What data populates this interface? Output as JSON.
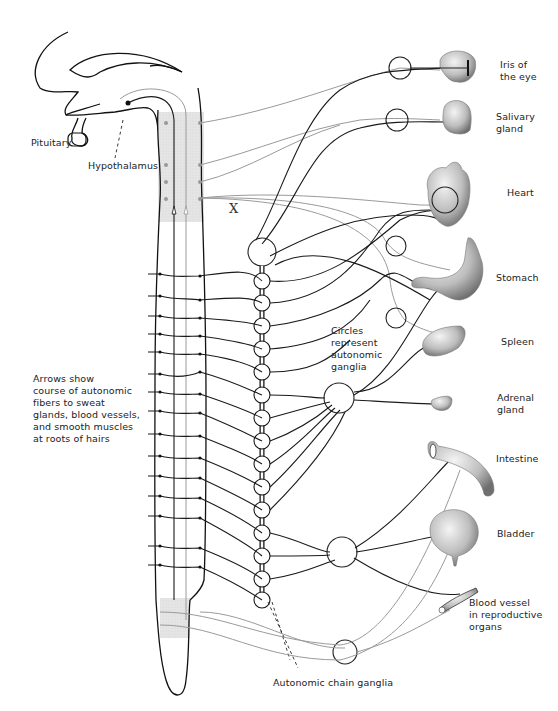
{
  "labels": {
    "pituitary": "Pituitary",
    "hypothalamus": "Hypothalamus",
    "x_marker": "X",
    "arrows_note": "Arrows show\ncourse of autonomic\nfibers to sweat\nglands, blood vessels,\nand smooth muscles\nat roots of hairs",
    "circles_note": "Circles\nrepresent\nautonomic\nganglia",
    "chain_ganglia": "Autonomic chain ganglia"
  },
  "organs": [
    {
      "id": "iris",
      "label": "Iris of\nthe eye"
    },
    {
      "id": "salivary",
      "label": "Salivary\ngland"
    },
    {
      "id": "heart",
      "label": "Heart"
    },
    {
      "id": "stomach",
      "label": "Stomach"
    },
    {
      "id": "spleen",
      "label": "Spleen"
    },
    {
      "id": "adrenal",
      "label": "Adrenal\ngland"
    },
    {
      "id": "intestine",
      "label": "Intestine"
    },
    {
      "id": "bladder",
      "label": "Bladder"
    },
    {
      "id": "blood-vessel",
      "label": "Blood vessel\nin reproductive\norgans"
    }
  ],
  "legend": {
    "black_fibers": "sympathetic",
    "gray_fibers": "parasympathetic",
    "black_color": "#1a1a1a",
    "gray_color": "#9a9a9a",
    "shading_color": "#dcdcdc"
  }
}
